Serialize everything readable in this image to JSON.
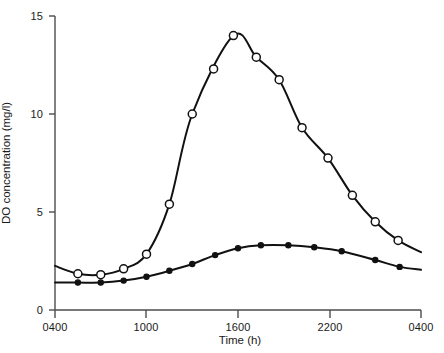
{
  "chart_data": {
    "type": "line",
    "title": "",
    "xlabel": "Time (h)",
    "ylabel": "DO concentration (mg/l)",
    "xtick_labels": [
      "0400",
      "1000",
      "1600",
      "2200",
      "0400"
    ],
    "xtick_hours": [
      4,
      10,
      16,
      22,
      28
    ],
    "ytick_labels": [
      "0",
      "5",
      "10",
      "15"
    ],
    "ytick_values": [
      0,
      5,
      10,
      15
    ],
    "xlim": [
      4,
      28
    ],
    "ylim": [
      0,
      15
    ],
    "grid": false,
    "legend": "none",
    "series": [
      {
        "name": "open-circle-series",
        "marker": "open-circle",
        "x": [
          5.5,
          7.0,
          8.5,
          10.0,
          11.5,
          13.0,
          14.4,
          15.7,
          17.2,
          18.7,
          20.2,
          21.9,
          23.5,
          25.0,
          26.5
        ],
        "y": [
          1.85,
          1.8,
          2.1,
          2.85,
          5.4,
          10.0,
          12.3,
          14.0,
          12.9,
          11.75,
          9.3,
          7.75,
          5.85,
          4.5,
          3.55
        ],
        "endpoints_y": [
          2.25,
          2.95
        ]
      },
      {
        "name": "filled-circle-series",
        "marker": "filled-circle",
        "x": [
          5.5,
          7.0,
          8.5,
          10.0,
          11.5,
          13.0,
          14.5,
          16.0,
          17.5,
          19.3,
          21.0,
          22.8,
          25.0,
          26.6
        ],
        "y": [
          1.4,
          1.4,
          1.5,
          1.7,
          2.0,
          2.35,
          2.8,
          3.15,
          3.3,
          3.3,
          3.2,
          3.0,
          2.55,
          2.2
        ],
        "endpoints_y": [
          1.4,
          2.05
        ]
      }
    ],
    "axis_color": "#4d4d4d",
    "curve_color": "#111111",
    "marker_fill_open": "#ffffff",
    "marker_fill_closed": "#111111"
  }
}
